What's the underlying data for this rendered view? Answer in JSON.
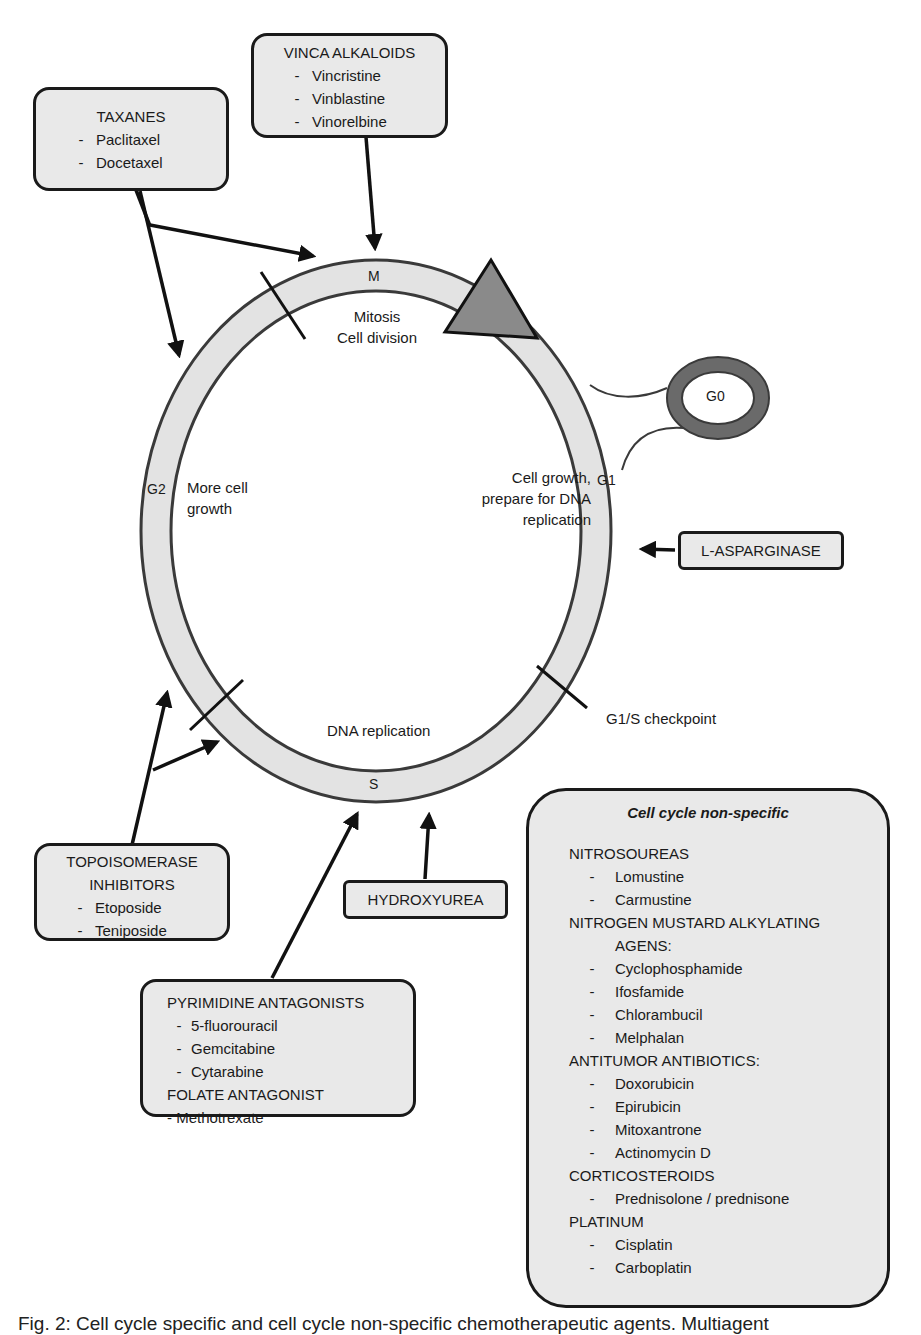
{
  "diagram": {
    "phases": {
      "M": "M",
      "G1": "G1",
      "S": "S",
      "G2": "G2",
      "G0": "G0"
    },
    "phase_descriptions": {
      "mitosis_line1": "Mitosis",
      "mitosis_line2": "Cell division",
      "g1_line1": "Cell growth,",
      "g1_line2": "prepare for DNA",
      "g1_line3": "replication",
      "g2_line1": "More cell",
      "g2_line2": "growth",
      "s": "DNA replication"
    },
    "checkpoint_label": "G1/S checkpoint",
    "colors": {
      "ring_fill": "#e3e3e3",
      "ring_stroke": "#3a3a3a",
      "triangle_fill": "#8a8a8a",
      "g0_ring": "#6a6a6a",
      "box_fill": "#e9e9e9",
      "box_stroke": "#1a1a1a"
    }
  },
  "boxes": {
    "taxanes": {
      "title": "TAXANES",
      "items": [
        "Paclitaxel",
        "Docetaxel"
      ]
    },
    "vinca": {
      "title": "VINCA ALKALOIDS",
      "items": [
        "Vincristine",
        "Vinblastine",
        "Vinorelbine"
      ]
    },
    "asparginase": {
      "title": "L-ASPARGINASE"
    },
    "topoisomerase": {
      "title_line1": "TOPOISOMERASE",
      "title_line2": "INHIBITORS",
      "items": [
        "Etoposide",
        "Teniposide"
      ]
    },
    "hydroxyurea": {
      "title": "HYDROXYUREA"
    },
    "antimetabolites": {
      "pyrimidine_title": "PYRIMIDINE ANTAGONISTS",
      "pyrimidine_items": [
        "5-fluorouracil",
        "Gemcitabine",
        "Cytarabine"
      ],
      "folate_title": "FOLATE ANTAGONIST",
      "folate_item": "- Methotrexate"
    },
    "non_specific": {
      "title": "Cell cycle non-specific",
      "groups": [
        {
          "heading": "NITROSOUREAS",
          "items": [
            "Lomustine",
            "Carmustine"
          ]
        },
        {
          "heading": "NITROGEN MUSTARD ALKYLATING",
          "heading_cont": "AGENS:",
          "items": [
            "Cyclophosphamide",
            "Ifosfamide",
            "Chlorambucil",
            "Melphalan"
          ]
        },
        {
          "heading": "ANTITUMOR ANTIBIOTICS:",
          "items": [
            "Doxorubicin",
            "Epirubicin",
            "Mitoxantrone",
            "Actinomycin D"
          ]
        },
        {
          "heading": "CORTICOSTEROIDS",
          "items": [
            "Prednisolone / prednisone"
          ]
        },
        {
          "heading": "PLATINUM",
          "items": [
            "Cisplatin",
            "Carboplatin"
          ]
        }
      ]
    }
  },
  "list_dash": "-",
  "caption": "Fig. 2: Cell cycle specific and cell cycle non-specific chemotherapeutic agents. Multiagent"
}
